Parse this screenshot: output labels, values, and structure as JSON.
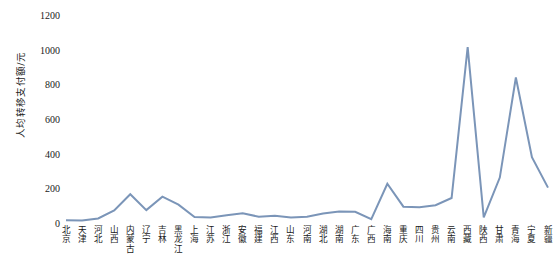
{
  "chart_data": {
    "type": "line",
    "title": "",
    "xlabel": "",
    "ylabel": "人均转移支付额/元",
    "ylim": [
      0,
      1200
    ],
    "yticks": [
      0,
      200,
      400,
      600,
      800,
      1000,
      1200
    ],
    "ytick_labels": [
      "0",
      "200",
      "400",
      "600",
      "800",
      "1000",
      "1200"
    ],
    "grid": false,
    "legend": "none",
    "line_color": "#7B95B8",
    "line_width": 2,
    "markers": false,
    "categories": [
      "北京",
      "天津",
      "河北",
      "山西",
      "内蒙古",
      "辽宁",
      "吉林",
      "黑龙江",
      "上海",
      "江苏",
      "浙江",
      "安徽",
      "福建",
      "江西",
      "山东",
      "河南",
      "湖北",
      "湖南",
      "广东",
      "广西",
      "海南",
      "重庆",
      "四川",
      "贵州",
      "云南",
      "西藏",
      "陕西",
      "甘肃",
      "青海",
      "宁夏",
      "新疆"
    ],
    "values": [
      22,
      20,
      32,
      78,
      172,
      80,
      158,
      112,
      40,
      38,
      50,
      62,
      42,
      48,
      38,
      42,
      60,
      72,
      70,
      28,
      232,
      100,
      96,
      108,
      150,
      1020,
      38,
      268,
      845,
      385,
      210
    ]
  }
}
